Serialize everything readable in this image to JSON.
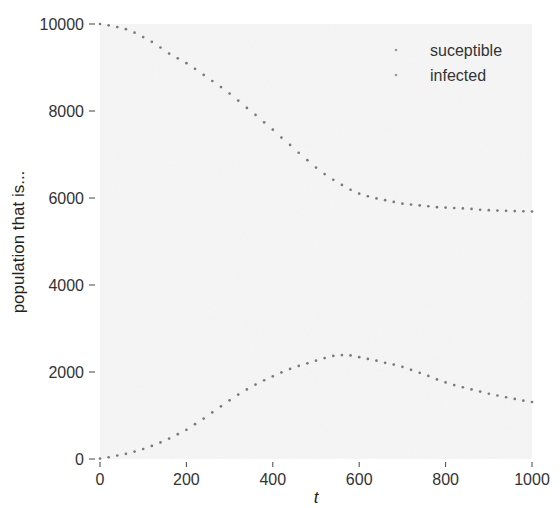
{
  "chart_data": {
    "type": "scatter",
    "title": "",
    "xlabel": "t",
    "ylabel": "population that is...",
    "xlim": [
      0,
      1000
    ],
    "ylim": [
      0,
      10000
    ],
    "xticks": [
      0,
      200,
      400,
      600,
      800,
      1000
    ],
    "yticks": [
      0,
      2000,
      4000,
      6000,
      8000,
      10000
    ],
    "grid": false,
    "legend_position": "upper right",
    "x": [
      0,
      20,
      40,
      60,
      80,
      100,
      120,
      140,
      160,
      180,
      200,
      220,
      240,
      260,
      280,
      300,
      320,
      340,
      360,
      380,
      400,
      420,
      440,
      460,
      480,
      500,
      520,
      540,
      560,
      580,
      600,
      620,
      640,
      660,
      680,
      700,
      720,
      740,
      760,
      780,
      800,
      820,
      840,
      860,
      880,
      900,
      920,
      940,
      960,
      980,
      1000
    ],
    "series": [
      {
        "name": "suceptible",
        "color": "#7a7a7a",
        "values": [
          10000,
          9970,
          9930,
          9880,
          9800,
          9700,
          9590,
          9460,
          9320,
          9210,
          9100,
          8970,
          8830,
          8690,
          8550,
          8400,
          8240,
          8070,
          7910,
          7740,
          7570,
          7390,
          7220,
          7040,
          6870,
          6700,
          6550,
          6420,
          6300,
          6190,
          6100,
          6040,
          5990,
          5950,
          5910,
          5870,
          5850,
          5830,
          5810,
          5790,
          5780,
          5770,
          5760,
          5750,
          5730,
          5720,
          5710,
          5705,
          5700,
          5695,
          5690
        ]
      },
      {
        "name": "infected",
        "color": "#7a7a7a",
        "values": [
          10,
          40,
          80,
          120,
          170,
          230,
          300,
          380,
          470,
          570,
          670,
          800,
          930,
          1070,
          1210,
          1350,
          1480,
          1600,
          1710,
          1810,
          1900,
          1990,
          2070,
          2140,
          2200,
          2260,
          2320,
          2370,
          2390,
          2380,
          2340,
          2300,
          2260,
          2210,
          2170,
          2120,
          2050,
          1980,
          1910,
          1830,
          1760,
          1700,
          1650,
          1600,
          1550,
          1500,
          1460,
          1420,
          1380,
          1340,
          1310
        ]
      }
    ]
  }
}
